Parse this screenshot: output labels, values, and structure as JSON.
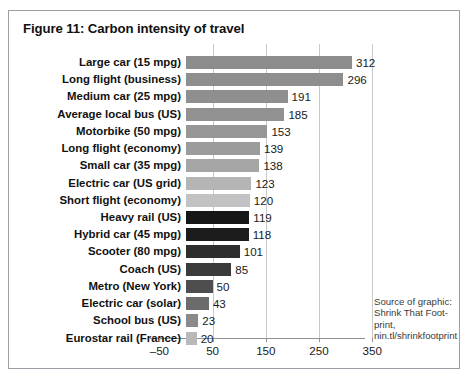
{
  "figure": {
    "title": "Figure 11: Carbon intensity of travel",
    "source_note": "Source of graphic: Shrink That Foot-print, nin.tl/shrinkfootprint"
  },
  "chart_data": {
    "type": "bar",
    "orientation": "horizontal",
    "title": "Figure 11: Carbon intensity of travel",
    "xlabel": "",
    "ylabel": "",
    "xlim": [
      -50,
      350
    ],
    "xticks": [
      -50,
      50,
      150,
      250,
      350
    ],
    "xticklabels": [
      "–50",
      "50",
      "150",
      "250",
      "350"
    ],
    "grid": true,
    "gridlines_at": [
      50,
      150,
      250,
      350
    ],
    "legend": "none",
    "categories": [
      "Large car (15 mpg)",
      "Long flight (business)",
      "Medium car (25 mpg)",
      "Average local bus (US)",
      "Motorbike (50 mpg)",
      "Long flight (economy)",
      "Small car (35 mpg)",
      "Electric car (US grid)",
      "Short flight (economy)",
      "Heavy rail (US)",
      "Hybrid car (45 mpg)",
      "Scooter (80 mpg)",
      "Coach (US)",
      "Metro (New York)",
      "Electric car (solar)",
      "School bus (US)",
      "Eurostar rail (France)"
    ],
    "values": [
      312,
      296,
      191,
      185,
      153,
      139,
      138,
      123,
      120,
      119,
      118,
      101,
      85,
      50,
      43,
      23,
      20
    ],
    "bar_colors": [
      "#8c8c8c",
      "#8e8e8e",
      "#8f8f8f",
      "#919191",
      "#979797",
      "#9c9c9c",
      "#a5a5a5",
      "#b5b5b5",
      "#c2c2c2",
      "#161616",
      "#1c1c1c",
      "#2e2e2e",
      "#3b3b3b",
      "#4e4e4e",
      "#6b6b6b",
      "#8a8a8a",
      "#b9b9b9"
    ]
  }
}
